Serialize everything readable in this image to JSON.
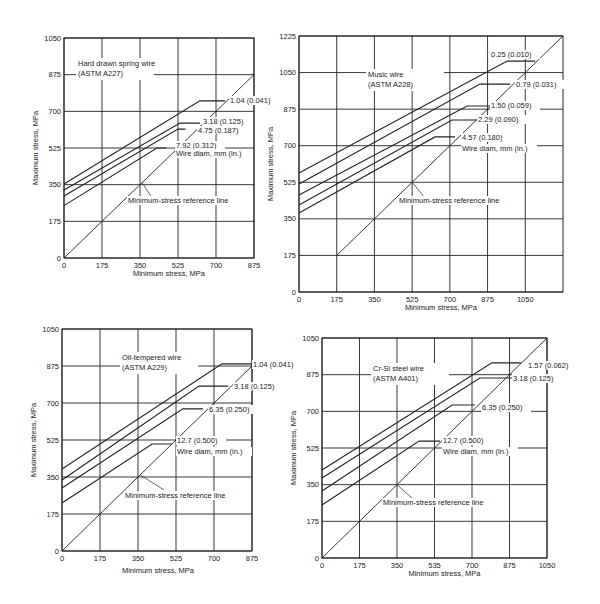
{
  "page": {
    "background": "#ffffff",
    "ink": "#222222"
  },
  "chart_data": [
    {
      "type": "line",
      "id": "hard-drawn",
      "title": "Hard drawn spring wire",
      "subtitle": "(ASTM A227)",
      "xlabel": "Minimum stress, MPa",
      "ylabel": "Maximum stress, MPa",
      "xlim": [
        0,
        875
      ],
      "ylim": [
        0,
        1050
      ],
      "xticks": [
        "0",
        "175",
        "350",
        "525",
        "700",
        "875"
      ],
      "xtick_values": [
        0,
        175,
        350,
        525,
        700,
        875
      ],
      "yticks": [
        "0",
        "175",
        "350",
        "525",
        "700",
        "875",
        "1050"
      ],
      "ytick_values": [
        0,
        175,
        350,
        525,
        700,
        875,
        1050
      ],
      "grid": true,
      "frame": {
        "x0": 64,
        "x1": 254,
        "y0": 258,
        "y1": 38
      },
      "title_pos": [
        78,
        66
      ],
      "legend_title": "Wire diam, mm (in.)",
      "legend_title_pos": [
        176,
        156
      ],
      "reference_line": {
        "label": "Minimum-stress reference line",
        "from": [
          0,
          0
        ],
        "to": [
          875,
          875
        ],
        "label_pos": [
          128,
          203
        ],
        "pointer_from": [
          152,
          198
        ],
        "pointer_to_value": [
          360,
          360
        ]
      },
      "series": [
        {
          "name": "1.04 (0.041)",
          "points": [
            [
              0,
              353
            ],
            [
              626,
              750
            ],
            [
              742,
              750
            ]
          ],
          "label_pos": [
            230,
            103
          ]
        },
        {
          "name": "3.18 (0.125)",
          "points": [
            [
              0,
              325
            ],
            [
              534,
              644
            ],
            [
              626,
              644
            ]
          ],
          "label_pos": [
            203,
            124
          ]
        },
        {
          "name": "4.75 (0.187)",
          "points": [
            [
              0,
              296
            ],
            [
              525,
              615
            ],
            [
              560,
              615
            ]
          ],
          "label_pos": [
            198,
            133
          ]
        },
        {
          "name": "7.92 (0.312)",
          "points": [
            [
              0,
              250
            ],
            [
              428,
              525
            ],
            [
              470,
              525
            ]
          ],
          "label_pos": [
            176,
            148
          ]
        }
      ]
    },
    {
      "type": "line",
      "id": "music-wire",
      "title": "Music wire",
      "subtitle": "(ASTM A228)",
      "xlabel": "Minimum stress, MPa",
      "ylabel": "Maximum stress, MPa",
      "xlim": [
        0,
        1225
      ],
      "ylim": [
        0,
        1225
      ],
      "xticks": [
        "0",
        "175",
        "350",
        "525",
        "700",
        "875",
        "1050"
      ],
      "xtick_values": [
        0,
        175,
        350,
        525,
        700,
        875,
        1050
      ],
      "yticks": [
        "0",
        "175",
        "350",
        "525",
        "700",
        "875",
        "1050",
        "1225"
      ],
      "ytick_values": [
        0,
        175,
        350,
        525,
        700,
        875,
        1050,
        1225
      ],
      "grid": true,
      "frame": {
        "x0": 299,
        "x1": 563,
        "y0": 292,
        "y1": 36
      },
      "title_pos": [
        368,
        77
      ],
      "legend_title": "Wire diam, mm (in.)",
      "legend_title_pos": [
        462,
        151
      ],
      "reference_line": {
        "label": "Minimum-stress reference line",
        "from": [
          175,
          175
        ],
        "to": [
          1225,
          1225
        ],
        "label_pos": [
          399,
          203
        ],
        "pointer_from": [
          425,
          198
        ],
        "pointer_to_value": [
          525,
          525
        ]
      },
      "series": [
        {
          "name": "0.25 (0.010)",
          "points": [
            [
              0,
              570
            ],
            [
              966,
              1105
            ],
            [
              1096,
              1105
            ]
          ],
          "label_pos": [
            491,
            57
          ]
        },
        {
          "name": "0.79 (0.031)",
          "points": [
            [
              0,
              517
            ],
            [
              840,
              995
            ],
            [
              980,
              995
            ]
          ],
          "label_pos": [
            516,
            87
          ]
        },
        {
          "name": "1.50 (0.059)",
          "points": [
            [
              0,
              464
            ],
            [
              780,
              890
            ],
            [
              900,
              890
            ]
          ],
          "label_pos": [
            491,
            108
          ]
        },
        {
          "name": "2.29 (0.090)",
          "points": [
            [
              0,
              416
            ],
            [
              710,
              823
            ],
            [
              831,
              823
            ]
          ],
          "label_pos": [
            478,
            122
          ]
        },
        {
          "name": "4.57 (0.180)",
          "points": [
            [
              0,
              378
            ],
            [
              631,
              742
            ],
            [
              724,
              742
            ]
          ],
          "label_pos": [
            462,
            140
          ]
        }
      ]
    },
    {
      "type": "line",
      "id": "oil-tempered",
      "title": "Oil-tempered wire",
      "subtitle": "(ASTM A229)",
      "xlabel": "Minimum stress, MPa",
      "ylabel": "Maximum stress, MPa",
      "xlim": [
        0,
        875
      ],
      "ylim": [
        0,
        1050
      ],
      "xticks": [
        "0",
        "175",
        "350",
        "525",
        "700",
        "875"
      ],
      "xtick_values": [
        0,
        175,
        350,
        525,
        700,
        875
      ],
      "yticks": [
        "0",
        "175",
        "350",
        "525",
        "700",
        "875",
        "1050"
      ],
      "ytick_values": [
        0,
        175,
        350,
        525,
        700,
        875,
        1050
      ],
      "grid": true,
      "frame": {
        "x0": 62,
        "x1": 252,
        "y0": 551,
        "y1": 329
      },
      "title_pos": [
        122,
        360
      ],
      "legend_title": "Wire diam, mm (in.)",
      "legend_title_pos": [
        177,
        454
      ],
      "reference_line": {
        "label": "Minimum-stress reference line",
        "from": [
          0,
          0
        ],
        "to": [
          875,
          875
        ],
        "label_pos": [
          125,
          498
        ],
        "pointer_from": [
          164,
          490
        ],
        "pointer_to_value": [
          360,
          360
        ]
      },
      "series": [
        {
          "name": "1.04 (0.041)",
          "points": [
            [
              0,
              388
            ],
            [
              737,
              885
            ],
            [
              875,
              885
            ]
          ],
          "label_pos": [
            253,
            367
          ]
        },
        {
          "name": "3.18 (0.125)",
          "points": [
            [
              0,
              336
            ],
            [
              631,
              780
            ],
            [
              765,
              780
            ]
          ],
          "label_pos": [
            234,
            389
          ]
        },
        {
          "name": "6.35 (0.250)",
          "points": [
            [
              0,
              298
            ],
            [
              557,
              672
            ],
            [
              649,
              672
            ]
          ],
          "label_pos": [
            209,
            412
          ]
        },
        {
          "name": "12.7 (0.500)",
          "points": [
            [
              0,
              227
            ],
            [
              415,
              506
            ],
            [
              507,
              506
            ]
          ],
          "label_pos": [
            177,
            443
          ]
        }
      ],
      "xlabel_pos": [
        158,
        573
      ]
    },
    {
      "type": "line",
      "id": "cr-si-steel",
      "title": "Cr-Si steel wire",
      "subtitle": "(ASTM A401)",
      "xlabel": "Minimum stress, MPa",
      "ylabel": "Maximum stress, MPa",
      "xlim": [
        0,
        1050
      ],
      "ylim": [
        0,
        1050
      ],
      "xticks": [
        "0",
        "175",
        "350",
        "535",
        "700",
        "875",
        "1050"
      ],
      "xtick_values": [
        0,
        175,
        350,
        525,
        700,
        875,
        1050
      ],
      "yticks": [
        "0",
        "175",
        "350",
        "525",
        "700",
        "875",
        "1050"
      ],
      "ytick_values": [
        0,
        175,
        350,
        525,
        700,
        875,
        1050
      ],
      "grid": true,
      "frame": {
        "x0": 322,
        "x1": 547,
        "y0": 558,
        "y1": 338
      },
      "title_pos": [
        373,
        371
      ],
      "legend_title": "Wire diam, mm (in.)",
      "legend_title_pos": [
        443,
        454
      ],
      "reference_line": {
        "label": "Minimum-stress reference line",
        "from": [
          0,
          0
        ],
        "to": [
          1050,
          1050
        ],
        "label_pos": [
          383,
          505
        ],
        "pointer_from": [
          413,
          499
        ],
        "pointer_to_value": [
          350,
          350
        ]
      },
      "series": [
        {
          "name": "1.57 (0.062)",
          "points": [
            [
              0,
              420
            ],
            [
              793,
              931
            ],
            [
              929,
              931
            ]
          ],
          "label_pos": [
            528,
            368
          ]
        },
        {
          "name": "3.18 (0.125)",
          "points": [
            [
              0,
              382
            ],
            [
              737,
              859
            ],
            [
              887,
              859
            ]
          ],
          "label_pos": [
            513,
            381
          ]
        },
        {
          "name": "6.35 (0.250)",
          "points": [
            [
              0,
              320
            ],
            [
              607,
              730
            ],
            [
              714,
              730
            ]
          ],
          "label_pos": [
            482,
            410
          ]
        },
        {
          "name": "12.7 (0.500)",
          "points": [
            [
              0,
              253
            ],
            [
              453,
              558
            ],
            [
              551,
              558
            ]
          ],
          "label_pos": [
            443,
            443
          ]
        }
      ]
    }
  ]
}
